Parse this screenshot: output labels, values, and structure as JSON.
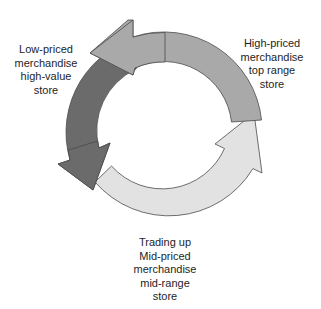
{
  "diagram": {
    "type": "cycle",
    "stages": [
      {
        "id": "low",
        "lines": [
          "Low-priced",
          "merchandise",
          "high-value",
          "store"
        ],
        "arrow_color": "#6b6b6b",
        "position": "left"
      },
      {
        "id": "mid",
        "lines": [
          "Trading up",
          "Mid-priced",
          "merchandise",
          "mid-range",
          "store"
        ],
        "arrow_color": "#e2e2e2",
        "position": "bottom"
      },
      {
        "id": "high",
        "lines": [
          "High-priced",
          "merchandise",
          "top range",
          "store"
        ],
        "arrow_color": "#a9a9a9",
        "position": "right"
      }
    ],
    "stroke_color": "#4a4a4a",
    "direction": "clockwise-flow: low → mid → high → low"
  }
}
